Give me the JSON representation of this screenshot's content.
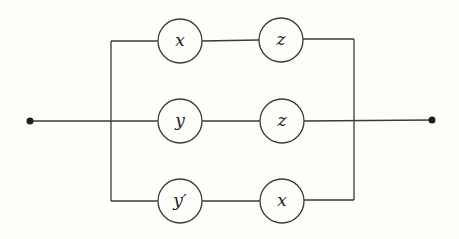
{
  "diagram": {
    "type": "series-parallel switching circuit",
    "colors": {
      "background": "#fdfdf9",
      "line": "#3a3a3a",
      "terminal": "#1e1e1e",
      "label": "#222222"
    },
    "terminals": {
      "left": {
        "x": 30,
        "y": 121
      },
      "right": {
        "x": 432,
        "y": 120
      }
    },
    "branches": [
      {
        "name": "top",
        "y": 41,
        "nodes": [
          {
            "label": "x",
            "cx": 180,
            "cy": 41
          },
          {
            "label": "z",
            "cx": 281,
            "cy": 41
          }
        ]
      },
      {
        "name": "middle",
        "y": 121,
        "nodes": [
          {
            "label": "y",
            "cx": 180,
            "cy": 121
          },
          {
            "label": "z",
            "cx": 282,
            "cy": 121
          }
        ]
      },
      {
        "name": "bottom",
        "y": 201,
        "nodes": [
          {
            "label": "y′",
            "cx": 180,
            "cy": 201
          },
          {
            "label": "x",
            "cx": 282,
            "cy": 201
          }
        ]
      }
    ],
    "node_radius": 22,
    "bus": {
      "left_x": 111,
      "right_x": 354
    }
  }
}
